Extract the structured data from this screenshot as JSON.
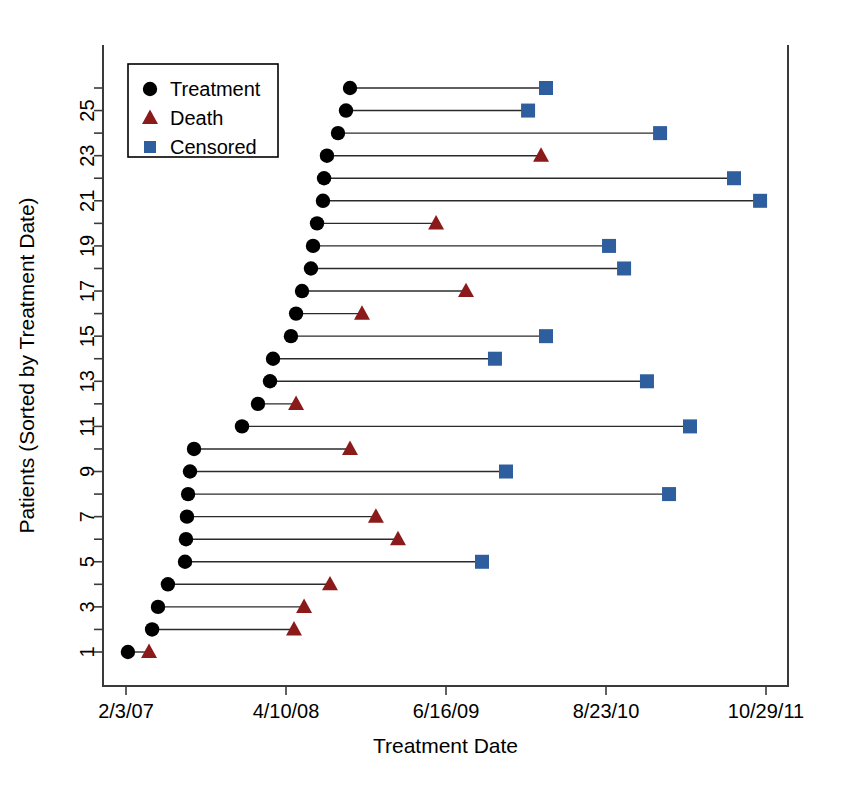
{
  "chart_data": {
    "type": "scatter",
    "subtype": "swimmer-plot",
    "title": "",
    "xlabel": "Treatment Date",
    "ylabel": "Patients (Sorted by Treatment Date)",
    "x_tick_labels": [
      "2/3/07",
      "4/10/08",
      "6/16/09",
      "8/23/10",
      "10/29/11"
    ],
    "x_tick_values": [
      0,
      1,
      2,
      3,
      4
    ],
    "xlim": [
      -0.17,
      4.14
    ],
    "y_tick_labels": [
      "1",
      "3",
      "5",
      "7",
      "9",
      "11",
      "13",
      "15",
      "17",
      "19",
      "21",
      "23",
      "25"
    ],
    "y_tick_values": [
      1,
      3,
      5,
      7,
      9,
      11,
      13,
      15,
      17,
      19,
      21,
      23,
      25
    ],
    "ylim": [
      0.2,
      26.9
    ],
    "grid": false,
    "legend_position": "top-left",
    "legend": [
      {
        "label": "Treatment",
        "marker": "circle",
        "color": "#000000"
      },
      {
        "label": "Death",
        "marker": "triangle",
        "color": "#8B1A1A"
      },
      {
        "label": "Censored",
        "marker": "square",
        "color": "#2E5E9E"
      }
    ],
    "colors": {
      "treatment": "#000000",
      "death": "#8B1A1A",
      "censored": "#2E5E9E",
      "segment": "#2b2b2b",
      "axis": "#3a3a3a"
    },
    "series": [
      {
        "name": "Treatment",
        "marker": "circle"
      },
      {
        "name": "Death",
        "marker": "triangle"
      },
      {
        "name": "Censored",
        "marker": "square"
      }
    ],
    "points": [
      {
        "patient": 1,
        "start": 0.012,
        "end": 0.144,
        "end_event": "Death"
      },
      {
        "patient": 2,
        "start": 0.163,
        "end": 1.05,
        "end_event": "Death"
      },
      {
        "patient": 3,
        "start": 0.2,
        "end": 1.113,
        "end_event": "Death"
      },
      {
        "patient": 4,
        "start": 0.262,
        "end": 1.275,
        "end_event": "Death"
      },
      {
        "patient": 5,
        "start": 0.369,
        "end": 2.225,
        "end_event": "Censored"
      },
      {
        "patient": 6,
        "start": 0.375,
        "end": 1.7,
        "end_event": "Death"
      },
      {
        "patient": 7,
        "start": 0.381,
        "end": 1.562,
        "end_event": "Death"
      },
      {
        "patient": 8,
        "start": 0.388,
        "end": 3.394,
        "end_event": "Censored"
      },
      {
        "patient": 9,
        "start": 0.4,
        "end": 2.375,
        "end_event": "Censored"
      },
      {
        "patient": 10,
        "start": 0.425,
        "end": 1.4,
        "end_event": "Death"
      },
      {
        "patient": 11,
        "start": 0.725,
        "end": 3.525,
        "end_event": "Censored"
      },
      {
        "patient": 12,
        "start": 0.825,
        "end": 1.063,
        "end_event": "Death"
      },
      {
        "patient": 13,
        "start": 0.9,
        "end": 3.256,
        "end_event": "Censored"
      },
      {
        "patient": 14,
        "start": 0.919,
        "end": 2.306,
        "end_event": "Censored"
      },
      {
        "patient": 15,
        "start": 1.031,
        "end": 2.625,
        "end_event": "Censored"
      },
      {
        "patient": 16,
        "start": 1.063,
        "end": 1.475,
        "end_event": "Death"
      },
      {
        "patient": 17,
        "start": 1.1,
        "end": 2.125,
        "end_event": "Death"
      },
      {
        "patient": 18,
        "start": 1.156,
        "end": 3.113,
        "end_event": "Censored"
      },
      {
        "patient": 19,
        "start": 1.169,
        "end": 3.019,
        "end_event": "Censored"
      },
      {
        "patient": 20,
        "start": 1.194,
        "end": 1.938,
        "end_event": "Death"
      },
      {
        "patient": 21,
        "start": 1.231,
        "end": 3.963,
        "end_event": "Censored"
      },
      {
        "patient": 22,
        "start": 1.238,
        "end": 3.8,
        "end_event": "Censored"
      },
      {
        "patient": 23,
        "start": 1.256,
        "end": 2.594,
        "end_event": "Death"
      },
      {
        "patient": 24,
        "start": 1.325,
        "end": 3.338,
        "end_event": "Censored"
      },
      {
        "patient": 25,
        "start": 1.375,
        "end": 2.513,
        "end_event": "Censored"
      },
      {
        "patient": 26,
        "start": 1.4,
        "end": 2.625,
        "end_event": "Censored"
      }
    ]
  }
}
